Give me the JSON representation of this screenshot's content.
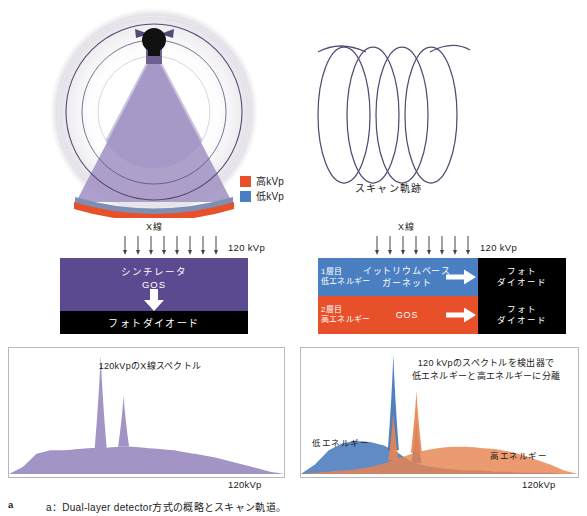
{
  "figure": {
    "panel_marker": "a",
    "caption": "a：Dual-layer detector方式の概略とスキャン軌道。"
  },
  "gantry": {
    "name": "ct-gantry-schematic",
    "tube_label": "x-ray-tube",
    "beam_label": "fan-beam",
    "rotation_label": "rotation-arrows"
  },
  "legend": {
    "items": [
      {
        "label": "高kVp",
        "color": "#e8502a",
        "key": "high-kvp"
      },
      {
        "label": "低kVp",
        "color": "#4a7fc1",
        "key": "low-kvp"
      }
    ]
  },
  "helix": {
    "caption": "スキャン軌跡",
    "loops": 4
  },
  "single_detector": {
    "xray_label": "X線",
    "kvp_label": "120 kVp",
    "arrow_count": 8,
    "scintillator_line1": "シンチレータ",
    "scintillator_line2": "GOS",
    "photodiode_label": "フォトダイオード",
    "scint_color": "#5b4a8f",
    "photodiode_color": "#000000"
  },
  "dual_detector": {
    "xray_label": "X線",
    "kvp_label": "120 kVp",
    "arrow_count": 8,
    "layers": [
      {
        "tag_line1": "1層目",
        "tag_line2": "低エネルギー",
        "scint_line1": "イットリウムベース",
        "scint_line2": "ガーネット",
        "photodiode_line1": "フォト",
        "photodiode_line2": "ダイオード",
        "color": "#4a7fc1",
        "key": "layer-1-low-energy"
      },
      {
        "tag_line1": "2層目",
        "tag_line2": "高エネルギー",
        "scint_line1": "GOS",
        "scint_line2": "",
        "photodiode_line1": "フォト",
        "photodiode_line2": "ダイオード",
        "color": "#e8502a",
        "key": "layer-2-high-energy"
      }
    ]
  },
  "chart_data": [
    {
      "type": "area",
      "key": "single-spectrum",
      "title": "120kVpのX線スペクトル",
      "xlabel": "120kVp",
      "ylabel": "",
      "axis_max_label": "120kVp",
      "xlim": [
        0,
        120
      ],
      "ylim": [
        0,
        100
      ],
      "grid": false,
      "legend_position": "none",
      "series": [
        {
          "name": "120kVp X線スペクトル",
          "color": "#a294c4",
          "bremsstrahlung": {
            "x": [
              0,
              6,
              12,
              18,
              24,
              30,
              36,
              42,
              48,
              54,
              60,
              66,
              72,
              78,
              84,
              90,
              96,
              102,
              108,
              114,
              120
            ],
            "y": [
              0,
              6,
              17,
              20,
              20,
              21,
              22,
              22,
              23,
              23,
              22,
              21,
              20,
              18,
              16,
              14,
              11,
              8,
              5,
              2,
              0
            ]
          },
          "characteristic_peaks": [
            {
              "x": 40,
              "y": 100,
              "width": 2.6,
              "label": "K-alpha"
            },
            {
              "x": 50,
              "y": 66,
              "width": 2.4,
              "label": "K-beta"
            }
          ]
        }
      ]
    },
    {
      "type": "area",
      "key": "dual-spectrum",
      "title": "120 kVpのスペクトルを検出器で\n低エネルギーと高エネルギーに分離",
      "title_line1": "120 kVpのスペクトルを検出器で",
      "title_line2": "低エネルギーと高エネルギーに分離",
      "xlabel": "120kVp",
      "ylabel": "",
      "axis_max_label": "120kVp",
      "xlim": [
        0,
        120
      ],
      "ylim": [
        0,
        100
      ],
      "grid": false,
      "legend_position": "inline-annotation",
      "series": [
        {
          "name": "低エネルギー",
          "color": "#3d72b8",
          "annotation": "低エネルギー",
          "annotation_x": 18,
          "bremsstrahlung": {
            "x": [
              0,
              6,
              12,
              18,
              24,
              30,
              36,
              42,
              48,
              54,
              60,
              66,
              72,
              78,
              84,
              90,
              96,
              102,
              108,
              114,
              120
            ],
            "y": [
              0,
              8,
              20,
              26,
              28,
              27,
              24,
              18,
              10,
              7,
              5,
              4,
              3,
              3,
              2,
              2,
              1,
              1,
              1,
              0,
              0
            ]
          },
          "characteristic_peaks": [
            {
              "x": 40,
              "y": 100,
              "width": 2.4,
              "label": "K-alpha"
            },
            {
              "x": 50,
              "y": 46,
              "width": 2.2,
              "label": "K-beta"
            }
          ]
        },
        {
          "name": "高エネルギー",
          "color": "#e8844f",
          "annotation": "高エネルギー",
          "annotation_x": 86,
          "bremsstrahlung": {
            "x": [
              0,
              6,
              12,
              18,
              24,
              30,
              36,
              42,
              48,
              54,
              60,
              66,
              72,
              78,
              84,
              90,
              96,
              102,
              108,
              114,
              120
            ],
            "y": [
              0,
              1,
              2,
              3,
              4,
              6,
              9,
              13,
              17,
              20,
              22,
              23,
              23,
              22,
              21,
              19,
              16,
              12,
              8,
              3,
              0
            ]
          },
          "characteristic_peaks": [
            {
              "x": 40,
              "y": 52,
              "width": 2.2,
              "label": "K-alpha"
            },
            {
              "x": 50,
              "y": 70,
              "width": 2.4,
              "label": "K-beta"
            }
          ]
        }
      ]
    }
  ]
}
